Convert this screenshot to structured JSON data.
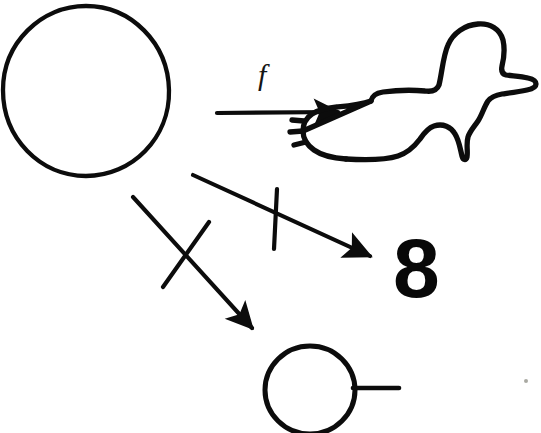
{
  "figure": {
    "name": "function-mapping-sketch",
    "background_color": "#ffffff",
    "ink_color": "#0c0c0c",
    "width": 541,
    "height": 433
  },
  "labels": {
    "function_label": "f",
    "digit_label": "8"
  },
  "shapes": {
    "source_circle": {
      "name": "large-circle",
      "cx": 86,
      "cy": 91,
      "rx": 83,
      "ry": 85,
      "stroke_width": 4.2
    },
    "duck": {
      "name": "duck-outline",
      "bbox": [
        356,
        22,
        537,
        160
      ],
      "stroke_width": 5.2,
      "feather_notches": 3
    },
    "target_circle": {
      "name": "small-circle-with-tail",
      "cx": 310,
      "cy": 390,
      "rx": 45,
      "ry": 44,
      "stroke_width": 5,
      "tail": {
        "x1": 353,
        "y1": 388,
        "x2": 399,
        "y2": 388
      }
    }
  },
  "arrows": [
    {
      "name": "arrow-f-to-duck",
      "from": [
        217,
        112
      ],
      "to": [
        347,
        112
      ],
      "crossed_out": false,
      "label": "f",
      "stroke_width": 4
    },
    {
      "name": "arrow-to-eight",
      "from": [
        193,
        175
      ],
      "to": [
        378,
        260
      ],
      "crossed_out": true,
      "cross_style": "vertical-stroke",
      "stroke_width": 4
    },
    {
      "name": "arrow-to-small-circle",
      "from": [
        133,
        197
      ],
      "to": [
        259,
        336
      ],
      "crossed_out": true,
      "cross_style": "diagonal-slash",
      "stroke_width": 4
    }
  ],
  "negation_marks": [
    {
      "name": "negation-stroke-vertical",
      "x1": 276,
      "y1": 189,
      "x2": 274,
      "y2": 248,
      "stroke_width": 4
    },
    {
      "name": "negation-stroke-diagonal",
      "x1": 163,
      "y1": 286,
      "x2": 208,
      "y2": 223,
      "stroke_width": 4
    }
  ],
  "artifacts": {
    "scan_speck": {
      "name": "scan-speck",
      "x": 524,
      "y": 379,
      "color": "#9a9a92"
    }
  }
}
